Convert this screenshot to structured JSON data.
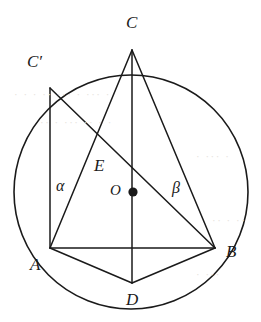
{
  "figure": {
    "background_color": "#ffffff",
    "stroke_color": "#1a1a1a",
    "label_color": "#1a1a1a",
    "width": 261,
    "height": 322
  },
  "circle": {
    "name": "circumscribed-circle",
    "center_x": 131,
    "center_y": 192,
    "radius": 117,
    "stroke_width": 1.6
  },
  "center_marker": {
    "name": "center-point-dot",
    "x": 133,
    "y": 192,
    "radius": 4.6
  },
  "points": [
    {
      "id": "C",
      "label": "C",
      "x": 132,
      "y": 50,
      "label_x": 126,
      "label_y": 14
    },
    {
      "id": "Cp",
      "label": "C′",
      "x": 50,
      "y": 88,
      "label_x": 27,
      "label_y": 53
    },
    {
      "id": "A",
      "label": "A",
      "x": 50,
      "y": 248,
      "label_x": 30,
      "label_y": 256
    },
    {
      "id": "B",
      "label": "B",
      "x": 215,
      "y": 248,
      "label_x": 226,
      "label_y": 243
    },
    {
      "id": "D",
      "label": "D",
      "x": 132,
      "y": 283,
      "label_x": 126,
      "label_y": 291
    },
    {
      "id": "E",
      "label": "E",
      "x": 104,
      "y": 172,
      "label_x": 94,
      "label_y": 157
    },
    {
      "id": "O",
      "label": "O",
      "x": 133,
      "y": 192,
      "label_x": 110,
      "label_y": 183
    }
  ],
  "segments": [
    {
      "name": "segment-c-prime-a",
      "from": "Cp",
      "to": "A",
      "x1": 50,
      "y1": 88,
      "x2": 50,
      "y2": 248
    },
    {
      "name": "segment-c-prime-b",
      "from": "Cp",
      "to": "B",
      "x1": 50,
      "y1": 88,
      "x2": 215,
      "y2": 248
    },
    {
      "name": "segment-c-a",
      "from": "C",
      "to": "A",
      "x1": 132,
      "y1": 50,
      "x2": 50,
      "y2": 248
    },
    {
      "name": "segment-c-d",
      "from": "C",
      "to": "D",
      "x1": 132,
      "y1": 50,
      "x2": 132,
      "y2": 283
    },
    {
      "name": "segment-c-b",
      "from": "C",
      "to": "B",
      "x1": 132,
      "y1": 50,
      "x2": 215,
      "y2": 248
    },
    {
      "name": "segment-a-b",
      "from": "A",
      "to": "B",
      "x1": 50,
      "y1": 248,
      "x2": 215,
      "y2": 248
    },
    {
      "name": "segment-a-d",
      "from": "A",
      "to": "D",
      "x1": 50,
      "y1": 248,
      "x2": 132,
      "y2": 283
    },
    {
      "name": "segment-d-b",
      "from": "D",
      "to": "B",
      "x1": 132,
      "y1": 283,
      "x2": 215,
      "y2": 248
    }
  ],
  "angles": [
    {
      "id": "alpha",
      "label": "α",
      "at_point": "A",
      "label_x": 56,
      "label_y": 178
    },
    {
      "id": "beta",
      "label": "β",
      "at_point": "B",
      "label_x": 172,
      "label_y": 180
    }
  ],
  "bleed_text": [
    {
      "text": "· · ·  ·· ···  · ··· ·",
      "x": 14,
      "y": 88
    },
    {
      "text": "·· · ···  ·· · ·",
      "x": 40,
      "y": 116
    },
    {
      "text": "· ··· ·",
      "x": 196,
      "y": 150
    },
    {
      "text": "·· · ··",
      "x": 212,
      "y": 214
    },
    {
      "text": "· ···",
      "x": 196,
      "y": 268
    }
  ]
}
